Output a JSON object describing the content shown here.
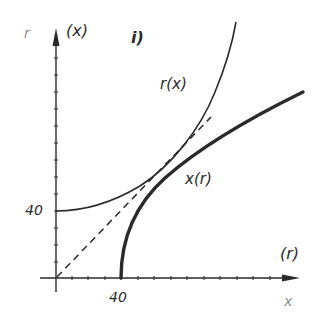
{
  "figure": {
    "panel_label": "i)",
    "y_axis": {
      "label_primary": "(x)",
      "label_secondary": "r",
      "tick_label": "40"
    },
    "x_axis": {
      "label_primary": "(r)",
      "label_secondary": "x",
      "tick_label": "40"
    },
    "curves": [
      {
        "name": "r(x)",
        "label": "r(x)",
        "style": "thin solid"
      },
      {
        "name": "x(r)",
        "label": "x(r)",
        "style": "thick solid"
      },
      {
        "name": "identity",
        "label": "",
        "style": "dashed"
      }
    ],
    "colors": {
      "ink": "#2a2a2a",
      "background": "#ffffff"
    }
  }
}
